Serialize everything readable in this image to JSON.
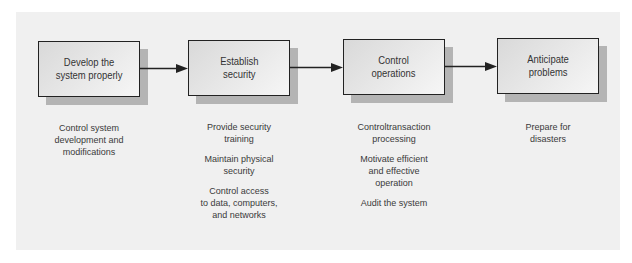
{
  "diagram": {
    "type": "process-flow",
    "colors": {
      "panel_background": "#f0f0f0",
      "box_border": "#222222",
      "box_shadow": "#b4b4b4",
      "arrow": "#222222",
      "text": "#333333"
    },
    "steps": [
      {
        "label": "Develop the\nsystem properly",
        "actions": [
          "Control system\ndevelopment and\nmodifications"
        ]
      },
      {
        "label": "Establish\nsecurity",
        "actions": [
          "Provide security\ntraining",
          "Maintain physical\nsecurity",
          "Control access\nto data, computers,\nand networks"
        ]
      },
      {
        "label": "Control\noperations",
        "actions": [
          "Controltransaction\nprocessing",
          "Motivate efficient\nand effective\noperation",
          "Audit the system"
        ]
      },
      {
        "label": "Anticipate\nproblems",
        "actions": [
          "Prepare for\ndisasters"
        ]
      }
    ],
    "connections": [
      {
        "from": 0,
        "to": 1
      },
      {
        "from": 1,
        "to": 2
      },
      {
        "from": 2,
        "to": 3
      }
    ]
  }
}
